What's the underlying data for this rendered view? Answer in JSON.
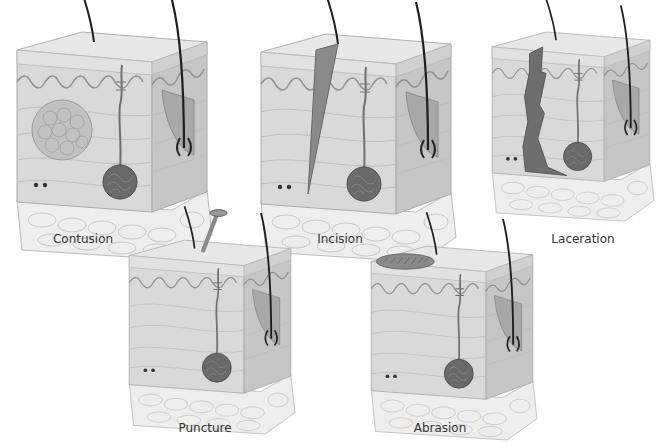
{
  "figure": {
    "panels": [
      {
        "id": "contusion",
        "label": "Contusion",
        "feature": "bruised-tissue-cluster"
      },
      {
        "id": "incision",
        "label": "Incision",
        "feature": "clean-straight-cut"
      },
      {
        "id": "laceration",
        "label": "Laceration",
        "feature": "jagged-torn-wound"
      },
      {
        "id": "puncture",
        "label": "Puncture",
        "feature": "nail-penetration"
      },
      {
        "id": "abrasion",
        "label": "Abrasion",
        "feature": "scraped-surface"
      }
    ]
  },
  "colors": {
    "skin_front": "#d7d7d7",
    "skin_side": "#c4c4c4",
    "skin_top": "#e6e6e6",
    "fat_layer": "#ececec",
    "hair": "#1e1e1e",
    "wound_dark": "#6a6a6a",
    "gland": "#5a5a5a",
    "caption": "#333333"
  }
}
